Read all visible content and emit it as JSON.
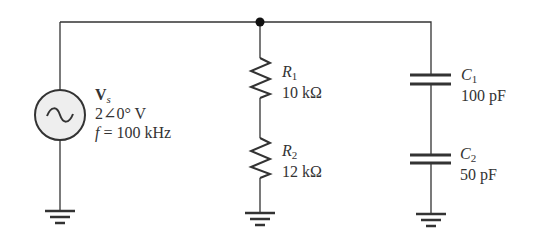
{
  "diagram": {
    "type": "circuit-schematic",
    "colors": {
      "wire": "#333333",
      "source_fill": "#eeeeee",
      "text": "#333333"
    },
    "source": {
      "symbol": "V",
      "subscript": "s",
      "magnitude_phase": "2∠0° V",
      "frequency_label": "f",
      "frequency_value": "= 100 kHz",
      "icon": "ac-source-icon"
    },
    "resistors": [
      {
        "symbol": "R",
        "subscript": "1",
        "value": "10 kΩ"
      },
      {
        "symbol": "R",
        "subscript": "2",
        "value": "12 kΩ"
      }
    ],
    "capacitors": [
      {
        "symbol": "C",
        "subscript": "1",
        "value": "100 pF"
      },
      {
        "symbol": "C",
        "subscript": "2",
        "value": "50 pF"
      }
    ],
    "grounds": 3,
    "junctions": 1
  }
}
